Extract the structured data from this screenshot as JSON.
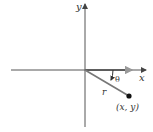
{
  "diagram": {
    "labels": {
      "x_axis": "x",
      "y_axis": "y",
      "radius": "r",
      "angle": "θ",
      "point": "(x, y)"
    },
    "colors": {
      "axis": "#555555",
      "segment": "#666666",
      "point": "#111111",
      "arrow_gray": "#888888",
      "text": "#333333"
    },
    "geometry": {
      "origin": [
        85,
        70
      ],
      "point": [
        129,
        96
      ],
      "x_axis_range": [
        11,
        146
      ],
      "y_axis_range": [
        3,
        127
      ]
    }
  }
}
